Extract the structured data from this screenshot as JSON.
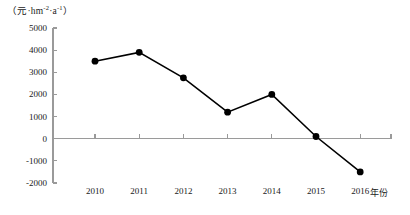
{
  "chart_data": {
    "type": "line",
    "title": "",
    "subtitle": "",
    "xlabel": "年份",
    "ylabel": "（元·hm-2·a-1）",
    "ylabel_parts": {
      "open": "（",
      "unit_currency": "元",
      "sep1": "·",
      "unit_area": "hm",
      "sup_area": "-2",
      "sep2": "·",
      "unit_time": "a",
      "sup_time": "-1",
      "close": "）"
    },
    "categories": [
      "2010",
      "2011",
      "2012",
      "2013",
      "2014",
      "2015",
      "2016"
    ],
    "x": [
      2010,
      2011,
      2012,
      2013,
      2014,
      2015,
      2016
    ],
    "values": [
      3500,
      3900,
      2750,
      1200,
      2000,
      100,
      -1500
    ],
    "series": [
      {
        "name": "",
        "values": [
          3500,
          3900,
          2750,
          1200,
          2000,
          100,
          -1500
        ],
        "color": "#000000",
        "marker": "filled-circle"
      }
    ],
    "ylim": [
      -2000,
      5000
    ],
    "ytick_values": [
      5000,
      4000,
      3000,
      2000,
      1000,
      0,
      -1000,
      -2000
    ],
    "ytick_labels": [
      "5000",
      "4000",
      "3000",
      "2000",
      "1000",
      "0",
      "-1000",
      "-2000"
    ],
    "xtick_labels": [
      "2010",
      "2011",
      "2012",
      "2013",
      "2014",
      "2015",
      "2016"
    ],
    "grid": false,
    "legend": null,
    "legend_position": "none",
    "zero_line": true,
    "axis_color": "#9a9a9a",
    "line_color": "#000000",
    "marker_color": "#000000",
    "background": "#ffffff"
  }
}
